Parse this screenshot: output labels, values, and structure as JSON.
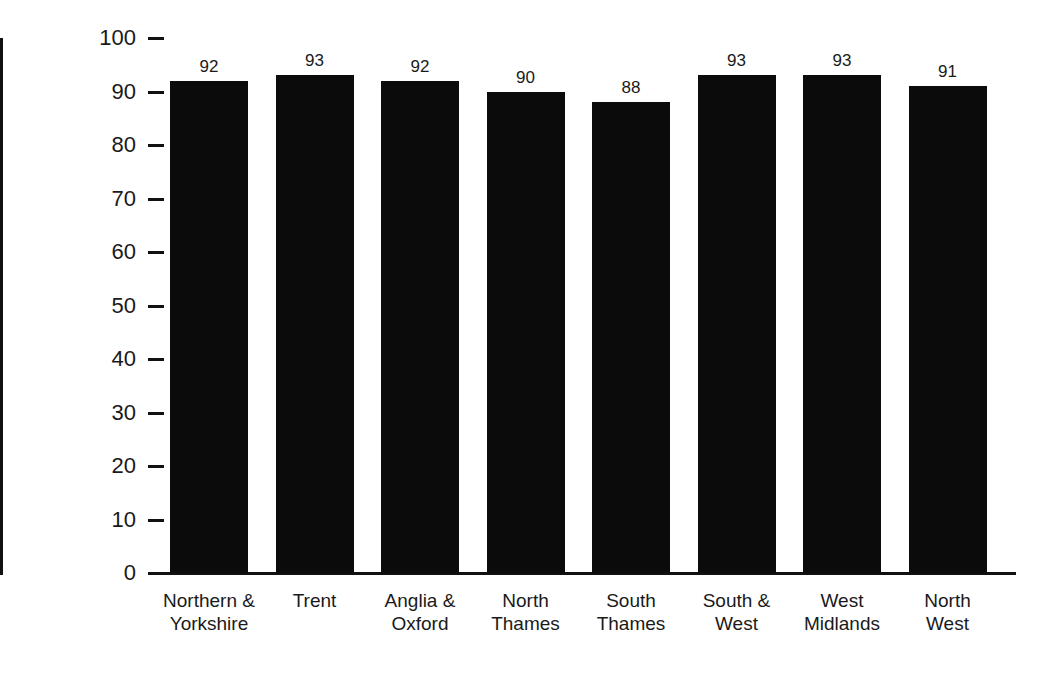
{
  "chart_data": {
    "type": "bar",
    "title": "",
    "subtitle": "",
    "xlabel": "",
    "ylabel": "Coverage (%)",
    "ylim": [
      0,
      100
    ],
    "ytick_step": 10,
    "yticks": [
      0,
      10,
      20,
      30,
      40,
      50,
      60,
      70,
      80,
      90,
      100
    ],
    "ytick_labels": [
      "0",
      "10",
      "20",
      "30",
      "40",
      "50",
      "60",
      "70",
      "80",
      "90",
      "100"
    ],
    "grid": false,
    "legend": "none",
    "orientation": "vertical",
    "bar_color": "#0b0b0b",
    "background_color": "#ffffff",
    "axis_color": "#111111",
    "value_labels_shown": true,
    "categories": [
      "Northern &\nYorkshire",
      "Trent",
      "Anglia &\nOxford",
      "North\nThames",
      "South\nThames",
      "South &\nWest",
      "West\nMidlands",
      "North\nWest"
    ],
    "values": [
      92,
      93,
      92,
      90,
      88,
      93,
      93,
      91
    ],
    "value_label_texts": [
      "92",
      "93",
      "92",
      "90",
      "88",
      "93",
      "93",
      "91"
    ],
    "series": [
      {
        "name": "Coverage",
        "values": [
          92,
          93,
          92,
          90,
          88,
          93,
          93,
          91
        ]
      }
    ]
  }
}
